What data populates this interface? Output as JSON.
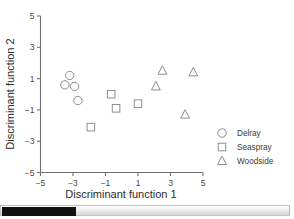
{
  "chart_data": {
    "type": "scatter",
    "title": "",
    "xlabel": "Discriminant function 1",
    "ylabel": "Discriminant function 2",
    "xlim": [
      -5,
      5
    ],
    "ylim": [
      -5,
      5
    ],
    "xticks": [
      "−5",
      "−3",
      "−1",
      "1",
      "3",
      "5"
    ],
    "xtick_values": [
      -5,
      -3,
      -1,
      1,
      3,
      5
    ],
    "yticks": [
      "5",
      "3",
      "1",
      "−1",
      "−3",
      "−5"
    ],
    "ytick_values": [
      5,
      3,
      1,
      -1,
      -3,
      -5
    ],
    "grid": false,
    "legend_position": "right-bottom",
    "series": [
      {
        "name": "Delray",
        "marker": "circle",
        "color": "#8d8d8d",
        "points": [
          {
            "x": -3.5,
            "y": 0.6
          },
          {
            "x": -3.2,
            "y": 1.2
          },
          {
            "x": -2.9,
            "y": 0.5
          },
          {
            "x": -2.7,
            "y": -0.4
          }
        ]
      },
      {
        "name": "Seaspray",
        "marker": "square",
        "color": "#8d8d8d",
        "points": [
          {
            "x": -1.9,
            "y": -2.1
          },
          {
            "x": -0.65,
            "y": 0.0
          },
          {
            "x": -0.35,
            "y": -0.9
          },
          {
            "x": 1.0,
            "y": -0.6
          }
        ]
      },
      {
        "name": "Woodside",
        "marker": "triangle",
        "color": "#8d8d8d",
        "points": [
          {
            "x": 2.1,
            "y": 0.5
          },
          {
            "x": 2.5,
            "y": 1.5
          },
          {
            "x": 4.4,
            "y": 1.4
          },
          {
            "x": 3.9,
            "y": -1.3
          }
        ]
      }
    ]
  },
  "legend": {
    "entries": [
      {
        "label": "Delray",
        "marker": "circle"
      },
      {
        "label": "Seaspray",
        "marker": "square"
      },
      {
        "label": "Woodside",
        "marker": "triangle"
      }
    ]
  },
  "scrollbar": {
    "orientation": "horizontal",
    "thumb_position_percent": 0,
    "thumb_width_percent": 26
  }
}
